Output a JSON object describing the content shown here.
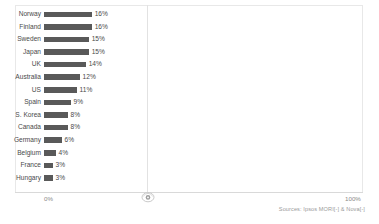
{
  "chart_data": {
    "type": "bar",
    "orientation": "horizontal",
    "title": "",
    "subtitle": "",
    "xlabel": "",
    "ylabel": "",
    "grid": false,
    "legend": null,
    "xlim": [
      0,
      100
    ],
    "categories": [
      "Norway",
      "Finland",
      "Sweden",
      "Japan",
      "UK",
      "Australia",
      "US",
      "Spain",
      "S. Korea",
      "Canada",
      "Germany",
      "Belgium",
      "France",
      "Hungary"
    ],
    "values": [
      16,
      16,
      15,
      15,
      14,
      12,
      11,
      9,
      8,
      8,
      6,
      4,
      3,
      3
    ],
    "value_labels": [
      "16%",
      "16%",
      "15%",
      "15%",
      "14%",
      "12%",
      "11%",
      "9%",
      "8%",
      "8%",
      "6%",
      "4%",
      "3%",
      "3%"
    ],
    "axis_ticks": {
      "min_label": "0%",
      "max_label": "100%"
    },
    "bar_color": "#595959"
  },
  "footer": {
    "source": "Sources: Ipsos MORI[-] & Nova[-]"
  },
  "icons": {
    "divider_handle": "drag-handle-icon"
  },
  "colors": {
    "bar": "#595959",
    "frame": "#e8e8e8",
    "axis": "#d9d9d9",
    "divider": "#e2e2e2",
    "label_text": "#4a4a4a",
    "tick_text": "#8a8a8a",
    "source_text": "#9a9a9a"
  }
}
